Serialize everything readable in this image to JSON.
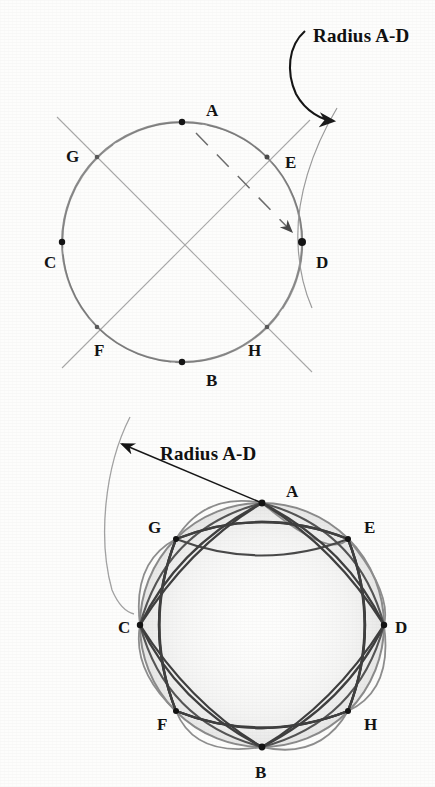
{
  "page": {
    "background_color": "#fdfdfc",
    "ink_color": "#2b2b2b",
    "pencil_light_color": "#9a9a9a",
    "pencil_mid_color": "#6f6f6f",
    "pencil_dark_color": "#3a3a3a",
    "width": 435,
    "height": 787
  },
  "figures": [
    {
      "id": "construction-circle",
      "callout_label": "Radius A-D",
      "circle": {
        "cx": 182,
        "cy": 242,
        "r": 120
      },
      "points": [
        {
          "name": "A",
          "label": "A",
          "angle_deg": 270,
          "x": 182,
          "y": 122,
          "label_x": 206,
          "label_y": 116
        },
        {
          "name": "B",
          "label": "B",
          "angle_deg": 90,
          "x": 182,
          "y": 362,
          "label_x": 206,
          "label_y": 386
        },
        {
          "name": "C",
          "label": "C",
          "angle_deg": 180,
          "x": 62,
          "y": 242,
          "label_x": 44,
          "label_y": 268
        },
        {
          "name": "D",
          "label": "D",
          "angle_deg": 0,
          "x": 302,
          "y": 242,
          "label_x": 316,
          "label_y": 268
        },
        {
          "name": "E",
          "label": "E",
          "angle_deg": 315,
          "x": 267,
          "y": 157,
          "label_x": 285,
          "label_y": 168
        },
        {
          "name": "F",
          "label": "F",
          "angle_deg": 135,
          "x": 97,
          "y": 327,
          "label_x": 94,
          "label_y": 356
        },
        {
          "name": "G",
          "label": "G",
          "angle_deg": 225,
          "x": 97,
          "y": 157,
          "label_x": 66,
          "label_y": 162
        },
        {
          "name": "H",
          "label": "H",
          "angle_deg": 45,
          "x": 267,
          "y": 327,
          "label_x": 248,
          "label_y": 356
        }
      ],
      "axes": [
        "horizontal C-D",
        "vertical A-B",
        "diagonal G-H",
        "diagonal E-F"
      ],
      "dashed_chord": {
        "from": "A",
        "to": "D",
        "style": "dashed-with-arrow"
      }
    },
    {
      "id": "woven-star-circle",
      "callout_label": "Radius A-D",
      "circle": {
        "cx": 262,
        "cy": 625,
        "r": 122
      },
      "points": [
        {
          "name": "A",
          "label": "A",
          "angle_deg": 270,
          "x": 262,
          "y": 503,
          "label_x": 286,
          "label_y": 496
        },
        {
          "name": "B",
          "label": "B",
          "angle_deg": 90,
          "x": 262,
          "y": 747,
          "label_x": 258,
          "label_y": 775
        },
        {
          "name": "C",
          "label": "C",
          "angle_deg": 180,
          "x": 140,
          "y": 625,
          "label_x": 122,
          "label_y": 633
        },
        {
          "name": "D",
          "label": "D",
          "angle_deg": 0,
          "x": 384,
          "y": 625,
          "label_x": 392,
          "label_y": 633
        },
        {
          "name": "E",
          "label": "E",
          "angle_deg": 315,
          "x": 348,
          "y": 539,
          "label_x": 364,
          "label_y": 531
        },
        {
          "name": "F",
          "label": "F",
          "angle_deg": 135,
          "x": 176,
          "y": 711,
          "label_x": 160,
          "label_y": 727
        },
        {
          "name": "G",
          "label": "G",
          "angle_deg": 225,
          "x": 176,
          "y": 539,
          "label_x": 150,
          "label_y": 531
        },
        {
          "name": "H",
          "label": "H",
          "angle_deg": 45,
          "x": 348,
          "y": 711,
          "label_x": 362,
          "label_y": 727
        }
      ],
      "arc_chords": [
        "A-E",
        "E-D",
        "D-H",
        "H-B",
        "B-F",
        "F-C",
        "C-G",
        "G-A",
        "A-D",
        "D-B",
        "B-C",
        "C-A",
        "G-E",
        "E-H",
        "H-F",
        "F-G"
      ],
      "radius_arrow": {
        "from_x": 262,
        "from_y": 503,
        "to_x": 120,
        "to_y": 443
      },
      "guide_arc": {
        "start_x": 128,
        "start_y": 418,
        "end_x": 134,
        "end_y": 607,
        "bulge_x": 99,
        "bulge_y": 512
      }
    }
  ]
}
